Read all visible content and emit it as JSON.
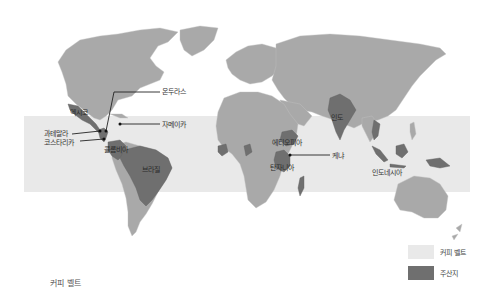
{
  "title": "커피 벨트",
  "colors": {
    "land": "#a9a9a9",
    "producer": "#6f6f6f",
    "belt": "#e9e9e9",
    "background": "#ffffff",
    "text": "#333333"
  },
  "legend": [
    {
      "label": "커피 벨트",
      "color": "#e9e9e9"
    },
    {
      "label": "주산지",
      "color": "#6f6f6f"
    }
  ],
  "labels": {
    "honduras": "온두라스",
    "jamaica": "자메이카",
    "guatemala": "과테말라",
    "costa_rica": "코스타리카",
    "mexico": "멕시코",
    "colombia": "콜롬비아",
    "brazil": "브라질",
    "ethiopia": "에티오피아",
    "kenya": "케냐",
    "tanzania": "탄자니아",
    "india": "인도",
    "indonesia": "인도네시아"
  }
}
